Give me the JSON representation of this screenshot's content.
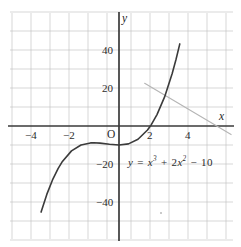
{
  "chart_data": {
    "type": "line",
    "title": "",
    "xlabel": "x",
    "ylabel": "y",
    "xlim": [
      -5.3,
      5.9
    ],
    "ylim": [
      -57,
      58
    ],
    "grid": true,
    "grid_step_x": 1,
    "grid_step_y": 10,
    "origin_label": "O",
    "xticks": [
      -4,
      -2,
      2,
      4
    ],
    "xtick_labels": [
      "−4",
      "−2",
      "2",
      "4"
    ],
    "yticks": [
      40,
      20,
      -20,
      -40
    ],
    "ytick_labels": [
      "40",
      "20",
      "−20",
      "−40"
    ],
    "series": [
      {
        "name": "y = x³ + 2x² − 10",
        "kind": "cubic",
        "coefficients": {
          "a": 1,
          "b": 2,
          "c": 0,
          "d": -10
        },
        "color": "#3b3b3b",
        "x_range": [
          -4.1,
          3.2
        ],
        "points": [
          {
            "x": -4.1,
            "y": -45.3
          },
          {
            "x": -3.8,
            "y": -36.0
          },
          {
            "x": -3.5,
            "y": -28.4
          },
          {
            "x": -3.2,
            "y": -22.3
          },
          {
            "x": -3.0,
            "y": -19.0
          },
          {
            "x": -2.5,
            "y": -13.1
          },
          {
            "x": -2.0,
            "y": -10.0
          },
          {
            "x": -1.5,
            "y": -8.9
          },
          {
            "x": -1.33,
            "y": -8.8
          },
          {
            "x": -1.0,
            "y": -9.0
          },
          {
            "x": -0.5,
            "y": -9.6
          },
          {
            "x": 0.0,
            "y": -10.0
          },
          {
            "x": 0.5,
            "y": -9.4
          },
          {
            "x": 1.0,
            "y": -7.0
          },
          {
            "x": 1.5,
            "y": -2.1
          },
          {
            "x": 1.7,
            "y": 0.7
          },
          {
            "x": 2.0,
            "y": 6.0
          },
          {
            "x": 2.4,
            "y": 15.3
          },
          {
            "x": 2.8,
            "y": 27.6
          },
          {
            "x": 3.0,
            "y": 35.0
          },
          {
            "x": 3.2,
            "y": 43.2
          }
        ]
      },
      {
        "name": "secondary-line",
        "kind": "line",
        "color": "#b5b5b5",
        "points": [
          {
            "x": 1.35,
            "y": 22.5
          },
          {
            "x": 5.9,
            "y": -4.5
          }
        ]
      }
    ],
    "annotations": [
      {
        "text": "y = x³ + 2x² − 10",
        "x": 1.05,
        "y": -17.0
      }
    ]
  },
  "equation": {
    "lhs": "y",
    "eq": "=",
    "term1_base": "x",
    "term1_exp": "3",
    "plus": "+",
    "term2_coef": "2",
    "term2_base": "x",
    "term2_exp": "2",
    "minus": "−",
    "constant": "10"
  },
  "axes": {
    "x_name": "x",
    "y_name": "y",
    "origin": "O"
  },
  "labels": {
    "x_neg4": "−4",
    "x_neg2": "−2",
    "x_2": "2",
    "x_4": "4",
    "y_40": "40",
    "y_20": "20",
    "y_neg20": "−20",
    "y_neg40": "−40"
  },
  "colors": {
    "curve": "#3b3b3b",
    "secondary_line": "#b5b5b5",
    "axis": "#3a3a3a",
    "grid": "#b9b9b9",
    "text": "#2b2b2b",
    "background": "#ffffff"
  }
}
